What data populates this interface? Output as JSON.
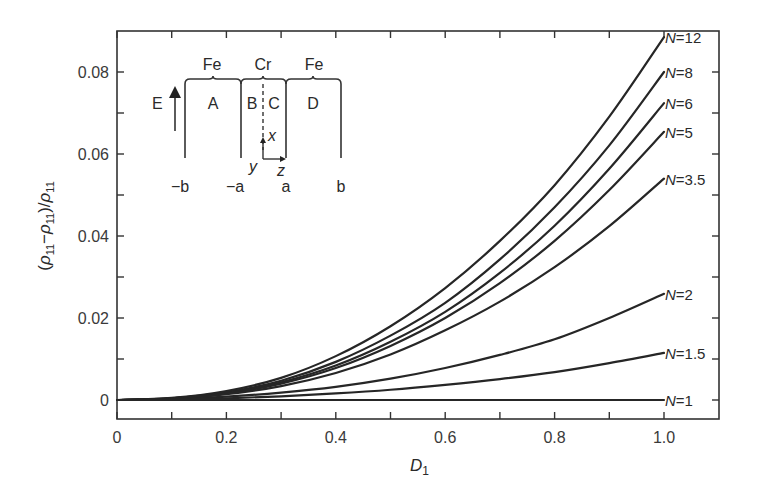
{
  "chart_data": {
    "type": "line",
    "title": "",
    "xlabel": "D1",
    "xlabel_main": "D",
    "xlabel_sub": "1",
    "ylabel": "(ρ11 − ρ11)/ρ11",
    "xlim": [
      0,
      1.1
    ],
    "ylim": [
      -0.0046,
      0.09
    ],
    "grid": false,
    "legend": "inline labels at curve ends",
    "x_ticks": [
      0,
      0.1,
      0.2,
      0.3,
      0.4,
      0.5,
      0.6,
      0.7,
      0.8,
      0.9,
      1.0
    ],
    "x_tick_labels": [
      "0",
      "0.2",
      "0.4",
      "0.6",
      "0.8",
      "1.0"
    ],
    "x_tick_label_values": [
      0,
      0.2,
      0.4,
      0.6,
      0.8,
      1.0
    ],
    "y_ticks": [
      0,
      0.01,
      0.02,
      0.03,
      0.04,
      0.05,
      0.06,
      0.07,
      0.08
    ],
    "y_tick_labels": [
      "0",
      "0.02",
      "0.04",
      "0.06",
      "0.08"
    ],
    "y_tick_label_values": [
      0,
      0.02,
      0.04,
      0.06,
      0.08
    ],
    "x": [
      0,
      0.1,
      0.2,
      0.3,
      0.4,
      0.5,
      0.6,
      0.7,
      0.8,
      0.9,
      1.0
    ],
    "series": [
      {
        "name": "N=12",
        "label_prefix": "N",
        "label_value": "12",
        "values": [
          0,
          0.0005,
          0.0022,
          0.0054,
          0.0107,
          0.018,
          0.0273,
          0.0388,
          0.0524,
          0.0691,
          0.0885
        ]
      },
      {
        "name": "N=8",
        "label_prefix": "N",
        "label_value": "8",
        "values": [
          0,
          0.0004,
          0.0019,
          0.0047,
          0.0093,
          0.0157,
          0.0237,
          0.0343,
          0.047,
          0.0621,
          0.08
        ]
      },
      {
        "name": "N=6",
        "label_prefix": "N",
        "label_value": "6",
        "values": [
          0,
          0.0004,
          0.0017,
          0.0043,
          0.0084,
          0.0142,
          0.0215,
          0.031,
          0.0425,
          0.0564,
          0.0724
        ]
      },
      {
        "name": "N=5",
        "label_prefix": "N",
        "label_value": "5",
        "values": [
          0,
          0.0004,
          0.0016,
          0.004,
          0.0078,
          0.0132,
          0.02,
          0.0285,
          0.0388,
          0.0512,
          0.0654
        ]
      },
      {
        "name": "N=3.5",
        "label_prefix": "N",
        "label_value": "3.5",
        "values": [
          0,
          0.0003,
          0.0014,
          0.0034,
          0.0066,
          0.0111,
          0.017,
          0.024,
          0.0324,
          0.0424,
          0.054
        ]
      },
      {
        "name": "N=2",
        "label_prefix": "N",
        "label_value": "2",
        "values": [
          0,
          0.0002,
          0.0008,
          0.0018,
          0.0032,
          0.0052,
          0.0078,
          0.011,
          0.0148,
          0.02,
          0.0259
        ]
      },
      {
        "name": "N=1.5",
        "label_prefix": "N",
        "label_value": "1.5",
        "values": [
          0,
          0.0001,
          0.0004,
          0.0009,
          0.0016,
          0.0025,
          0.0037,
          0.0051,
          0.0068,
          0.009,
          0.0115
        ]
      },
      {
        "name": "N=1",
        "label_prefix": "N",
        "label_value": "1",
        "values": [
          0,
          0,
          0,
          0,
          0,
          0,
          0,
          0,
          0,
          0,
          0
        ]
      }
    ],
    "inset": {
      "description": "Schematic of Fe/Cr/Fe trilayer with electric field E along x",
      "materials": [
        "Fe",
        "Cr",
        "Fe"
      ],
      "regions": [
        "A",
        "B",
        "C",
        "D"
      ],
      "boundaries": [
        "−b",
        "−a",
        "a",
        "b"
      ],
      "field_label": "E",
      "axes": [
        "x",
        "y",
        "z"
      ]
    }
  }
}
